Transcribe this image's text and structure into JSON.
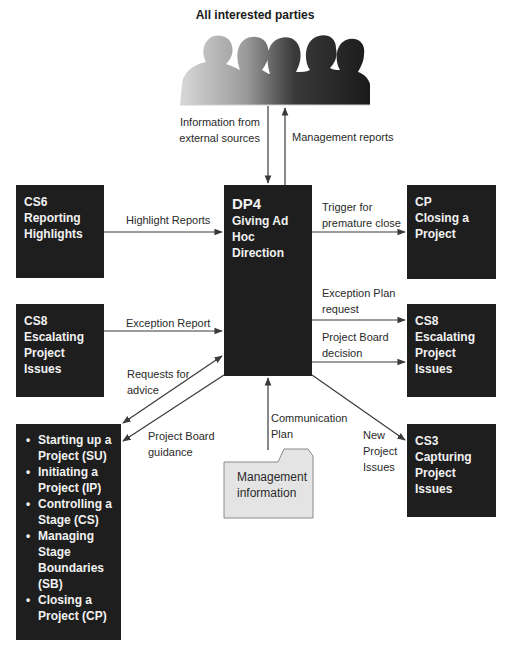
{
  "diagram": {
    "top_label": "All interested parties",
    "center": {
      "code": "DP4",
      "name": "Giving Ad Hoc Direction",
      "name_lines": [
        "Giving Ad",
        "Hoc",
        "Direction"
      ]
    },
    "boxes": {
      "cs6": {
        "code": "CS6",
        "name_lines": [
          "Reporting",
          "Highlights"
        ]
      },
      "cs8_left": {
        "code": "CS8",
        "name_lines": [
          "Escalating",
          "Project",
          "Issues"
        ]
      },
      "cp": {
        "code": "CP",
        "name_lines": [
          "Closing a",
          "Project"
        ]
      },
      "cs8_right": {
        "code": "CS8",
        "name_lines": [
          "Escalating",
          "Project",
          "Issues"
        ]
      },
      "cs3": {
        "code": "CS3",
        "name_lines": [
          "Capturing",
          "Project",
          "Issues"
        ]
      },
      "processes": {
        "items": [
          "Starting up a Project (SU)",
          "Initiating a Project (IP)",
          "Controlling a Stage (CS)",
          "Managing Stage Boundaries (SB)",
          "Closing a Project (CP)"
        ]
      }
    },
    "document": {
      "label_lines": [
        "Management",
        "information"
      ]
    },
    "flows": {
      "info_external": [
        "Information from",
        "external sources"
      ],
      "mgmt_reports": "Management reports",
      "highlight_reports": "Highlight Reports",
      "trigger_close": [
        "Trigger for",
        "premature close"
      ],
      "exception_report": "Exception Report",
      "exception_plan_request": [
        "Exception Plan",
        "request"
      ],
      "board_decision": [
        "Project Board",
        "decision"
      ],
      "requests_advice": [
        "Requests for",
        "advice"
      ],
      "board_guidance": [
        "Project Board",
        "guidance"
      ],
      "comm_plan": [
        "Communication",
        "Plan"
      ],
      "new_issues": [
        "New",
        "Project",
        "Issues"
      ]
    },
    "colors": {
      "box_fill": "#1e1e1e",
      "box_text": "#f2f2f2",
      "document_fill": "#e6e6e6",
      "arrow": "#3a3a3a"
    }
  }
}
